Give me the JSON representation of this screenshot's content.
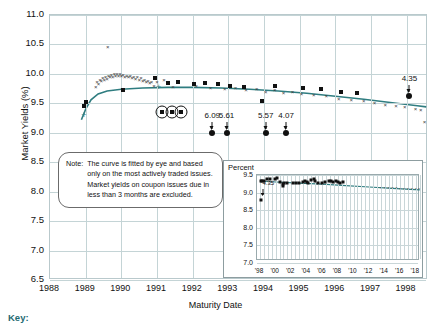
{
  "chart_data": {
    "type": "scatter",
    "title": "",
    "xlabel": "Maturity Date",
    "ylabel": "Market Yields (%)",
    "ylim": [
      6.5,
      11.0
    ],
    "yticks": [
      "6.5",
      "7.0",
      "7.5",
      "8.0",
      "8.5",
      "9.0",
      "9.5",
      "10.0",
      "10.5",
      "11.0"
    ],
    "xlim": [
      1988,
      1998.6
    ],
    "xticks": [
      "1988",
      "1989",
      "1990",
      "1991",
      "1992",
      "1993",
      "1994",
      "1995",
      "1996",
      "1997",
      "1998"
    ],
    "grid": true,
    "legend": "",
    "series": [
      {
        "name": "bills-x-markers",
        "marker": "x",
        "points": [
          [
            1989.62,
            10.45
          ],
          [
            1989.28,
            9.78
          ],
          [
            1989.32,
            9.86
          ],
          [
            1989.36,
            9.82
          ],
          [
            1989.4,
            9.9
          ],
          [
            1989.44,
            9.88
          ],
          [
            1989.48,
            9.93
          ],
          [
            1989.52,
            9.9
          ],
          [
            1989.56,
            9.95
          ],
          [
            1989.6,
            9.92
          ],
          [
            1989.64,
            9.97
          ],
          [
            1989.68,
            9.94
          ],
          [
            1989.72,
            9.98
          ],
          [
            1989.76,
            9.95
          ],
          [
            1989.8,
            9.99
          ],
          [
            1989.84,
            9.96
          ],
          [
            1989.88,
            10.0
          ],
          [
            1989.92,
            9.97
          ],
          [
            1989.96,
            9.99
          ],
          [
            1990.0,
            9.96
          ],
          [
            1990.05,
            9.98
          ],
          [
            1990.1,
            9.95
          ],
          [
            1990.15,
            9.97
          ],
          [
            1990.2,
            9.94
          ],
          [
            1990.25,
            9.96
          ],
          [
            1990.3,
            9.93
          ],
          [
            1990.35,
            9.95
          ],
          [
            1990.4,
            9.92
          ],
          [
            1990.45,
            9.94
          ],
          [
            1990.5,
            9.9
          ],
          [
            1990.55,
            9.93
          ],
          [
            1990.6,
            9.88
          ],
          [
            1990.65,
            9.9
          ],
          [
            1990.7,
            9.86
          ],
          [
            1990.75,
            9.88
          ],
          [
            1990.8,
            9.84
          ],
          [
            1990.85,
            9.86
          ],
          [
            1990.92,
            9.8
          ],
          [
            1991.0,
            9.86
          ],
          [
            1991.2,
            9.9
          ],
          [
            1991.45,
            9.78
          ],
          [
            1992.1,
            9.8
          ],
          [
            1992.5,
            9.76
          ],
          [
            1992.9,
            9.74
          ],
          [
            1993.2,
            9.76
          ],
          [
            1993.5,
            9.72
          ],
          [
            1993.8,
            9.74
          ],
          [
            1994.05,
            9.7
          ],
          [
            1994.3,
            9.72
          ],
          [
            1994.55,
            9.68
          ],
          [
            1994.8,
            9.7
          ],
          [
            1995.05,
            9.66
          ],
          [
            1995.4,
            9.64
          ],
          [
            1995.75,
            9.62
          ],
          [
            1996.1,
            9.58
          ],
          [
            1996.45,
            9.56
          ],
          [
            1996.8,
            9.54
          ],
          [
            1997.1,
            9.5
          ],
          [
            1997.4,
            9.48
          ],
          [
            1997.7,
            9.46
          ],
          [
            1997.95,
            9.44
          ],
          [
            1998.25,
            9.4
          ],
          [
            1998.4,
            9.38
          ],
          [
            1998.5,
            9.18
          ]
        ]
      },
      {
        "name": "coupon-issues-square-markers",
        "marker": "square",
        "points": [
          [
            1988.95,
            9.46
          ],
          [
            1989.02,
            9.52
          ],
          [
            1990.05,
            9.72
          ],
          [
            1990.95,
            9.93
          ],
          [
            1991.3,
            9.84
          ],
          [
            1991.6,
            9.86
          ],
          [
            1992.05,
            9.82
          ],
          [
            1992.35,
            9.84
          ],
          [
            1992.7,
            9.83
          ],
          [
            1993.05,
            9.8
          ],
          [
            1993.45,
            9.78
          ],
          [
            1993.95,
            9.54
          ],
          [
            1994.3,
            9.8
          ],
          [
            1995.1,
            9.76
          ],
          [
            1995.6,
            9.74
          ],
          [
            1996.15,
            9.7
          ],
          [
            1996.6,
            9.68
          ]
        ]
      },
      {
        "name": "excluded-circled-issues",
        "marker": "circled-square",
        "points": [
          [
            1991.15,
            9.36
          ],
          [
            1991.42,
            9.36
          ],
          [
            1991.68,
            9.35
          ]
        ]
      },
      {
        "name": "flagged-issues-dots",
        "marker": "dot",
        "points": [
          [
            1992.55,
            9.0
          ],
          [
            1992.95,
            9.0
          ],
          [
            1994.05,
            9.0
          ],
          [
            1994.62,
            9.0
          ],
          [
            1998.08,
            9.62
          ]
        ]
      },
      {
        "name": "fitted-curve",
        "marker": "line",
        "points": [
          [
            1988.88,
            9.22
          ],
          [
            1989.0,
            9.4
          ],
          [
            1989.15,
            9.56
          ],
          [
            1989.35,
            9.66
          ],
          [
            1989.6,
            9.71
          ],
          [
            1990.0,
            9.74
          ],
          [
            1990.6,
            9.76
          ],
          [
            1991.3,
            9.77
          ],
          [
            1992.0,
            9.77
          ],
          [
            1992.8,
            9.76
          ],
          [
            1993.6,
            9.74
          ],
          [
            1994.4,
            9.71
          ],
          [
            1995.2,
            9.67
          ],
          [
            1996.0,
            9.62
          ],
          [
            1996.8,
            9.57
          ],
          [
            1997.6,
            9.51
          ],
          [
            1998.3,
            9.46
          ],
          [
            1998.55,
            9.44
          ]
        ]
      }
    ],
    "annotations": [
      {
        "label": "6.09",
        "x": 1992.55,
        "y": 9.0
      },
      {
        "label": "5.61",
        "x": 1992.95,
        "y": 9.0
      },
      {
        "label": "5.57",
        "x": 1994.05,
        "y": 9.0
      },
      {
        "label": "4.07",
        "x": 1994.62,
        "y": 9.0
      },
      {
        "label": "4.35",
        "x": 1998.08,
        "y": 9.62
      }
    ]
  },
  "note": {
    "label": "Note:",
    "text": "The curve is fitted by eye and based only on the most actively traded issues. Market yields on coupon issues due in less than 3 months are excluded."
  },
  "inset": {
    "title": "Percent",
    "ylim": [
      7.0,
      9.5
    ],
    "yticks": [
      "7.0",
      "7.5",
      "8.0",
      "8.5",
      "9.0",
      "9.5"
    ],
    "xticks": [
      "'98",
      "'00",
      "'02",
      "'04",
      "'06",
      "'08",
      "'10",
      "'12",
      "'14",
      "'16",
      "'18"
    ],
    "annotation": "4.35",
    "chart_data": {
      "type": "scatter",
      "series": [
        {
          "name": "inset-squares",
          "marker": "square",
          "points": [
            [
              1998.1,
              9.33
            ],
            [
              1998.3,
              9.32
            ],
            [
              1998.5,
              9.34
            ],
            [
              1998.9,
              9.4
            ],
            [
              1999.3,
              9.38
            ],
            [
              1999.9,
              9.4
            ],
            [
              2000.2,
              9.41
            ],
            [
              2000.6,
              9.3
            ],
            [
              2000.9,
              9.24
            ],
            [
              2001.0,
              9.2
            ],
            [
              2001.1,
              9.26
            ],
            [
              2001.4,
              9.28
            ],
            [
              2002.2,
              9.28
            ],
            [
              2002.6,
              9.27
            ],
            [
              2003.0,
              9.28
            ],
            [
              2003.5,
              9.3
            ],
            [
              2003.8,
              9.32
            ],
            [
              2004.0,
              9.3
            ],
            [
              2004.2,
              9.28
            ],
            [
              2004.6,
              9.36
            ],
            [
              2004.9,
              9.38
            ],
            [
              2005.1,
              9.34
            ],
            [
              2005.5,
              9.26
            ],
            [
              2006.0,
              9.27
            ],
            [
              2006.4,
              9.3
            ],
            [
              2006.8,
              9.32
            ],
            [
              2007.1,
              9.34
            ],
            [
              2007.4,
              9.3
            ],
            [
              2007.8,
              9.32
            ],
            [
              2008.0,
              9.3
            ],
            [
              2008.3,
              9.28
            ],
            [
              2008.6,
              9.3
            ],
            [
              1998.15,
              8.78
            ]
          ]
        },
        {
          "name": "inset-x-markers",
          "marker": "x",
          "points": [
            [
              2013.5,
              9.14
            ],
            [
              2014.0,
              9.13
            ],
            [
              2014.5,
              9.13
            ],
            [
              2015.0,
              9.12
            ],
            [
              2015.5,
              9.12
            ],
            [
              2016.0,
              9.11
            ],
            [
              2016.5,
              9.11
            ],
            [
              2017.0,
              9.1
            ],
            [
              2017.5,
              9.1
            ],
            [
              2018.0,
              9.09
            ],
            [
              2018.4,
              9.09
            ]
          ]
        },
        {
          "name": "inset-fitted-curve",
          "marker": "line",
          "points": [
            [
              1998.0,
              9.33
            ],
            [
              2000.0,
              9.3
            ],
            [
              2003.0,
              9.27
            ],
            [
              2006.0,
              9.24
            ],
            [
              2009.0,
              9.2
            ],
            [
              2012.0,
              9.16
            ],
            [
              2015.0,
              9.12
            ],
            [
              2018.5,
              9.08
            ]
          ]
        }
      ]
    }
  },
  "key": {
    "label": "Key:"
  },
  "colors": {
    "curve": "#2f7d80",
    "grid": "#c4d4d6",
    "frame": "#b9c9cc",
    "key_text": "#1f6b72",
    "marker": "#111111"
  }
}
